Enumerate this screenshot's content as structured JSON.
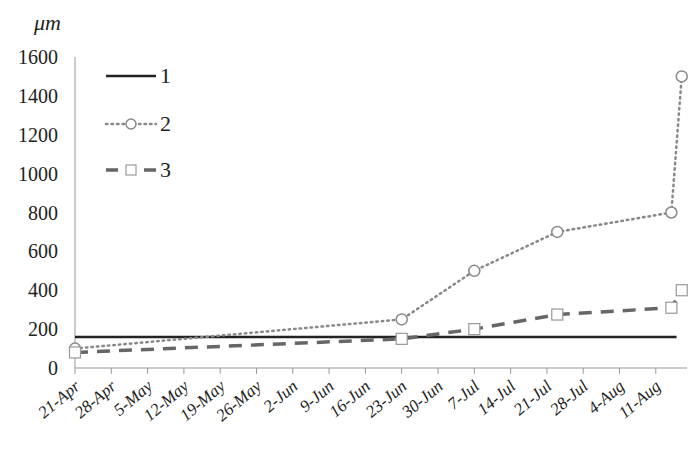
{
  "chart_data": {
    "type": "line",
    "title": "",
    "xlabel": "",
    "ylabel": "μm",
    "ylim": [
      0,
      1600
    ],
    "yticks": [
      0,
      200,
      400,
      600,
      800,
      1000,
      1200,
      1400,
      1600
    ],
    "grid": false,
    "legend_position": "upper-left",
    "categories": [
      "21-Apr",
      "28-Apr",
      "5-May",
      "12-May",
      "19-May",
      "26-May",
      "2-Jun",
      "9-Jun",
      "16-Jun",
      "23-Jun",
      "30-Jun",
      "7-Jul",
      "14-Jul",
      "21-Jul",
      "28-Jul",
      "4-Aug",
      "11-Aug"
    ],
    "series": [
      {
        "name": "1",
        "style": "solid",
        "marker": "none",
        "color": "#222222",
        "points": [
          {
            "x": "21-Apr",
            "y": 160
          },
          {
            "x": "15-Aug",
            "y": 160
          }
        ]
      },
      {
        "name": "2",
        "style": "dotted",
        "marker": "circle",
        "color": "#888888",
        "points": [
          {
            "x": "21-Apr",
            "y": 100
          },
          {
            "x": "23-Jun",
            "y": 250
          },
          {
            "x": "7-Jul",
            "y": 500
          },
          {
            "x": "23-Jul",
            "y": 700
          },
          {
            "x": "14-Aug",
            "y": 800
          },
          {
            "x": "16-Aug",
            "y": 1500
          }
        ]
      },
      {
        "name": "3",
        "style": "dashed",
        "marker": "square",
        "color": "#666666",
        "points": [
          {
            "x": "21-Apr",
            "y": 80
          },
          {
            "x": "23-Jun",
            "y": 150
          },
          {
            "x": "7-Jul",
            "y": 200
          },
          {
            "x": "23-Jul",
            "y": 275
          },
          {
            "x": "14-Aug",
            "y": 310
          },
          {
            "x": "16-Aug",
            "y": 400
          }
        ]
      }
    ]
  },
  "legend": [
    {
      "label": "1"
    },
    {
      "label": "2"
    },
    {
      "label": "3"
    }
  ],
  "axis": {
    "unit": "μm"
  }
}
